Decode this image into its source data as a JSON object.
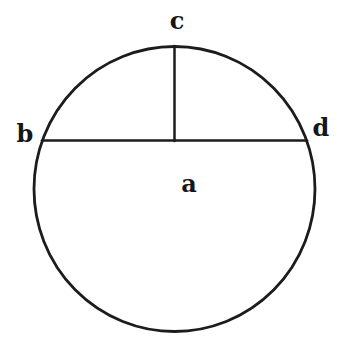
{
  "figure": {
    "type": "geometry-diagram",
    "labels": {
      "top_point": "c",
      "chord_left": "b",
      "chord_right": "d",
      "region": "a"
    },
    "stroke_color": "#1c1c1c",
    "background_color": "#ffffff"
  }
}
